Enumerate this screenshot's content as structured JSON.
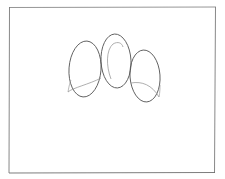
{
  "drawing": {
    "description": "Pencil sketch of three overlapping ovals inside a rectangular frame",
    "background": "#ffffff",
    "stroke_color": "#555555",
    "light_stroke_color": "#9a9a9a",
    "frame": {
      "x": 9,
      "y": 7,
      "width": 207,
      "height": 166
    },
    "ovals": [
      {
        "name": "left",
        "cx": 85,
        "cy": 69,
        "rx": 16,
        "ry": 28
      },
      {
        "name": "middle",
        "cx": 116,
        "cy": 61,
        "rx": 15,
        "ry": 27
      },
      {
        "name": "right",
        "cx": 145,
        "cy": 76,
        "rx": 15,
        "ry": 26
      }
    ]
  }
}
